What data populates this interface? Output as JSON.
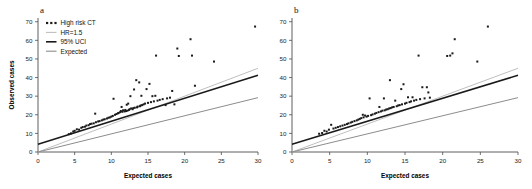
{
  "figure": {
    "width": 532,
    "height": 189,
    "background": "#ffffff"
  },
  "colors": {
    "point": "#1a1a1a",
    "hr_line": "#bfbfbf",
    "uci_line": "#1a1a1a",
    "expected_line": "#8c8c8c",
    "axis": "#4d4d4d",
    "text": "#111111"
  },
  "panels": [
    {
      "id": "a",
      "label": "a",
      "show_ylabel": true,
      "show_legend": true
    },
    {
      "id": "b",
      "label": "b",
      "show_ylabel": false,
      "show_legend": false
    }
  ],
  "legend": {
    "items": [
      {
        "label": "High risk CT",
        "marker": "dots",
        "color": "#1a1a1a"
      },
      {
        "label": "HR=1.5",
        "marker": "line",
        "color": "#bfbfbf"
      },
      {
        "label": "95% UCI",
        "marker": "line",
        "color": "#1a1a1a"
      },
      {
        "label": "Expected",
        "marker": "line",
        "color": "#8c8c8c"
      }
    ]
  },
  "chart_data": [
    {
      "type": "scatter",
      "panel": "a",
      "title": "a",
      "xlabel": "Expected cases",
      "ylabel": "Observed cases",
      "xlim": [
        0,
        30
      ],
      "ylim": [
        0,
        72
      ],
      "xticks": [
        0,
        5,
        10,
        15,
        20,
        25,
        30
      ],
      "yticks": [
        0,
        10,
        20,
        30,
        40,
        50,
        60,
        70
      ],
      "grid": false,
      "legend_position": "top-left",
      "series": [
        {
          "name": "High risk CT",
          "type": "scatter",
          "marker": "square",
          "color": "#1a1a1a",
          "points": [
            [
              4.2,
              9.6
            ],
            [
              4.5,
              10.0
            ],
            [
              4.8,
              11.0
            ],
            [
              5.0,
              11.4
            ],
            [
              5.3,
              12.2
            ],
            [
              5.6,
              12.0
            ],
            [
              5.9,
              13.0
            ],
            [
              6.1,
              13.4
            ],
            [
              6.4,
              13.6
            ],
            [
              6.6,
              14.2
            ],
            [
              6.9,
              14.4
            ],
            [
              7.1,
              15.0
            ],
            [
              7.3,
              15.2
            ],
            [
              7.6,
              15.4
            ],
            [
              7.8,
              20.6
            ],
            [
              7.9,
              16.0
            ],
            [
              8.2,
              16.4
            ],
            [
              8.4,
              16.6
            ],
            [
              8.7,
              17.0
            ],
            [
              8.9,
              17.4
            ],
            [
              9.1,
              17.6
            ],
            [
              9.4,
              18.0
            ],
            [
              9.6,
              18.4
            ],
            [
              9.8,
              18.6
            ],
            [
              10.0,
              19.0
            ],
            [
              10.2,
              19.4
            ],
            [
              10.3,
              28.6
            ],
            [
              10.5,
              20.0
            ],
            [
              10.7,
              20.4
            ],
            [
              10.9,
              20.8
            ],
            [
              11.0,
              21.0
            ],
            [
              11.2,
              21.4
            ],
            [
              11.3,
              22.0
            ],
            [
              11.4,
              24.2
            ],
            [
              11.5,
              21.6
            ],
            [
              11.6,
              22.4
            ],
            [
              11.8,
              21.8
            ],
            [
              11.9,
              22.6
            ],
            [
              12.0,
              22.0
            ],
            [
              12.1,
              25.4
            ],
            [
              12.2,
              22.2
            ],
            [
              12.3,
              26.0
            ],
            [
              12.4,
              22.6
            ],
            [
              12.5,
              23.0
            ],
            [
              12.6,
              30.0
            ],
            [
              12.7,
              23.4
            ],
            [
              12.9,
              23.0
            ],
            [
              13.0,
              23.6
            ],
            [
              13.1,
              33.6
            ],
            [
              13.2,
              23.8
            ],
            [
              13.4,
              38.6
            ],
            [
              13.5,
              24.0
            ],
            [
              13.6,
              24.4
            ],
            [
              13.8,
              37.4
            ],
            [
              13.9,
              24.6
            ],
            [
              14.0,
              25.0
            ],
            [
              14.1,
              30.2
            ],
            [
              14.2,
              25.2
            ],
            [
              14.4,
              25.6
            ],
            [
              14.6,
              26.0
            ],
            [
              14.8,
              33.8
            ],
            [
              15.0,
              26.4
            ],
            [
              15.2,
              36.6
            ],
            [
              15.4,
              26.8
            ],
            [
              15.6,
              30.0
            ],
            [
              15.8,
              27.2
            ],
            [
              16.0,
              30.2
            ],
            [
              16.1,
              51.8
            ],
            [
              16.3,
              27.6
            ],
            [
              16.6,
              28.0
            ],
            [
              17.0,
              28.4
            ],
            [
              17.4,
              25.2
            ],
            [
              17.6,
              28.8
            ],
            [
              18.0,
              29.2
            ],
            [
              18.3,
              32.8
            ],
            [
              18.6,
              25.6
            ],
            [
              19.0,
              55.6
            ],
            [
              19.2,
              51.6
            ],
            [
              20.8,
              60.6
            ],
            [
              21.0,
              51.8
            ],
            [
              21.4,
              35.6
            ],
            [
              24.0,
              48.6
            ],
            [
              29.6,
              67.4
            ]
          ]
        }
      ],
      "reference_lines": [
        {
          "name": "HR=1.5",
          "color": "#bfbfbf",
          "intercept": 0.0,
          "slope": 1.5,
          "x0": 0,
          "y0": 0,
          "x1": 30,
          "y1": 45
        },
        {
          "name": "95% UCI",
          "color": "#1a1a1a",
          "intercept": 4.2,
          "slope": 1.233,
          "x0": 0,
          "y0": 4.2,
          "x1": 30,
          "y1": 41.2
        },
        {
          "name": "Expected",
          "color": "#8c8c8c",
          "intercept": 0.0,
          "slope": 0.973,
          "x0": 0,
          "y0": 0,
          "x1": 30,
          "y1": 29.2
        }
      ]
    },
    {
      "type": "scatter",
      "panel": "b",
      "title": "b",
      "xlabel": "Expected cases",
      "ylabel": "",
      "xlim": [
        0,
        30
      ],
      "ylim": [
        0,
        72
      ],
      "xticks": [
        0,
        5,
        10,
        15,
        20,
        25,
        30
      ],
      "yticks": [
        0,
        10,
        20,
        30,
        40,
        50,
        60,
        70
      ],
      "grid": false,
      "legend_position": "none",
      "series": [
        {
          "name": "High risk CT",
          "type": "scatter",
          "marker": "square",
          "color": "#1a1a1a",
          "points": [
            [
              3.6,
              9.8
            ],
            [
              4.0,
              10.2
            ],
            [
              4.3,
              11.4
            ],
            [
              4.6,
              11.0
            ],
            [
              4.9,
              12.0
            ],
            [
              5.2,
              14.6
            ],
            [
              5.5,
              12.6
            ],
            [
              5.8,
              13.0
            ],
            [
              6.1,
              13.4
            ],
            [
              6.4,
              13.8
            ],
            [
              6.7,
              14.2
            ],
            [
              7.0,
              14.6
            ],
            [
              7.3,
              15.0
            ],
            [
              7.5,
              15.4
            ],
            [
              7.8,
              15.8
            ],
            [
              8.0,
              16.2
            ],
            [
              8.3,
              16.6
            ],
            [
              8.6,
              17.0
            ],
            [
              8.8,
              17.4
            ],
            [
              9.0,
              17.8
            ],
            [
              9.2,
              18.2
            ],
            [
              9.4,
              20.0
            ],
            [
              9.5,
              18.6
            ],
            [
              9.7,
              19.6
            ],
            [
              9.9,
              19.0
            ],
            [
              10.1,
              19.4
            ],
            [
              10.3,
              28.8
            ],
            [
              10.5,
              19.8
            ],
            [
              10.7,
              20.2
            ],
            [
              11.0,
              20.6
            ],
            [
              11.2,
              21.0
            ],
            [
              11.5,
              21.4
            ],
            [
              11.6,
              24.2
            ],
            [
              11.8,
              21.8
            ],
            [
              12.0,
              22.2
            ],
            [
              12.2,
              28.8
            ],
            [
              12.3,
              22.4
            ],
            [
              12.5,
              22.8
            ],
            [
              12.7,
              23.0
            ],
            [
              12.9,
              23.4
            ],
            [
              13.0,
              38.6
            ],
            [
              13.1,
              23.6
            ],
            [
              13.3,
              24.0
            ],
            [
              13.5,
              24.2
            ],
            [
              13.7,
              27.6
            ],
            [
              13.9,
              24.6
            ],
            [
              14.1,
              25.0
            ],
            [
              14.3,
              25.2
            ],
            [
              14.5,
              33.8
            ],
            [
              14.6,
              25.6
            ],
            [
              14.8,
              36.4
            ],
            [
              15.0,
              26.0
            ],
            [
              15.2,
              26.4
            ],
            [
              15.4,
              29.4
            ],
            [
              15.6,
              26.8
            ],
            [
              15.8,
              27.2
            ],
            [
              16.0,
              29.4
            ],
            [
              16.2,
              27.6
            ],
            [
              16.5,
              28.0
            ],
            [
              16.8,
              51.8
            ],
            [
              17.0,
              28.4
            ],
            [
              17.3,
              34.8
            ],
            [
              17.6,
              28.8
            ],
            [
              17.9,
              34.8
            ],
            [
              18.1,
              32.0
            ],
            [
              18.3,
              29.2
            ],
            [
              20.6,
              51.6
            ],
            [
              21.0,
              51.8
            ],
            [
              21.3,
              53.0
            ],
            [
              21.6,
              60.6
            ],
            [
              24.6,
              48.6
            ],
            [
              26.0,
              67.4
            ]
          ]
        }
      ],
      "reference_lines": [
        {
          "name": "HR=1.5",
          "color": "#bfbfbf",
          "intercept": 0.0,
          "slope": 1.5,
          "x0": 0,
          "y0": 0,
          "x1": 30,
          "y1": 45
        },
        {
          "name": "95% UCI",
          "color": "#1a1a1a",
          "intercept": 4.2,
          "slope": 1.233,
          "x0": 0,
          "y0": 4.2,
          "x1": 30,
          "y1": 41.2
        },
        {
          "name": "Expected",
          "color": "#8c8c8c",
          "intercept": 0.0,
          "slope": 0.973,
          "x0": 0,
          "y0": 0,
          "x1": 30,
          "y1": 29.2
        }
      ]
    }
  ]
}
